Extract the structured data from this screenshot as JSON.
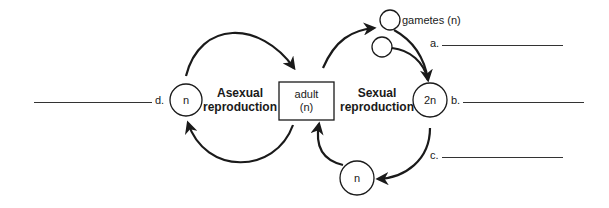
{
  "diagram": {
    "nodes": {
      "adult": {
        "line1": "adult",
        "line2": "(n)"
      },
      "left_n": {
        "label": "n"
      },
      "zygote": {
        "label": "2n"
      },
      "bottom_n": {
        "label": "n"
      },
      "gametes": {
        "label": "gametes (n)"
      }
    },
    "processes": {
      "asexual": {
        "line1": "Asexual",
        "line2": "reproduction"
      },
      "sexual": {
        "line1": "Sexual",
        "line2": "reproduction"
      }
    },
    "blanks": [
      {
        "letter": "a.",
        "answer": ""
      },
      {
        "letter": "b.",
        "answer": ""
      },
      {
        "letter": "c.",
        "answer": ""
      },
      {
        "letter": "d.",
        "answer": ""
      }
    ],
    "colors": {
      "stroke": "#1a1a1a",
      "background": "#ffffff"
    }
  }
}
